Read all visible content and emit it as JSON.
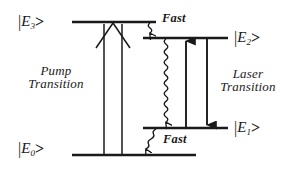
{
  "diagram": {
    "background_color": "#ffffff",
    "line_color": "#1a1a1a",
    "levels": [
      {
        "id": "E3",
        "label_bar": "|",
        "label_symbol": "E",
        "label_sub": "3",
        "label_gt": ">",
        "label_text": "|E3>",
        "x1": 72,
        "x2": 156,
        "y": 22,
        "label_x": 18,
        "label_y": 14
      },
      {
        "id": "E2",
        "label_bar": "|",
        "label_symbol": "E",
        "label_sub": "2",
        "label_gt": ">",
        "label_text": "|E2>",
        "x1": 143,
        "x2": 228,
        "y": 38,
        "label_x": 234,
        "label_y": 30
      },
      {
        "id": "E1",
        "label_bar": "|",
        "label_symbol": "E",
        "label_sub": "1",
        "label_gt": ">",
        "label_text": "|E1>",
        "x1": 143,
        "x2": 228,
        "y": 128,
        "label_x": 234,
        "label_y": 120
      },
      {
        "id": "E0",
        "label_bar": "|",
        "label_symbol": "E",
        "label_sub": "0",
        "label_gt": ">",
        "label_text": "|E0>",
        "x1": 72,
        "x2": 196,
        "y": 155,
        "label_x": 18,
        "label_y": 141
      }
    ],
    "transitions": {
      "pump": {
        "label_line1": "Pump",
        "label_line2": "Transition",
        "label_x": 14,
        "label_y": 64,
        "label_width": 84,
        "from_level": "E0",
        "to_level": "E3",
        "arrow_style": "thin-open-up",
        "arrow_left_x": 104,
        "arrow_right_x": 122,
        "apex_x": 113
      },
      "laser": {
        "label_line1": "Laser",
        "label_line2": "Transition",
        "label_x": 204,
        "label_y": 67,
        "label_width": 88,
        "up_arrow_x": 186,
        "down_arrow_x": 207,
        "from_level": "E1",
        "to_level": "E2",
        "arrow_style": "thick-filled"
      },
      "fast_decays": [
        {
          "id": "fast-E3-E2",
          "label": "Fast",
          "label_x": 182,
          "label_y": 12,
          "from_level": "E3",
          "to_level": "E2",
          "wave_x": 150,
          "y_start": 23,
          "y_end": 37,
          "style": "wavy-arrow-down"
        },
        {
          "id": "decay-E2-E1",
          "label": "",
          "label_x": 0,
          "label_y": 0,
          "from_level": "E2",
          "to_level": "E1",
          "wave_x": 166,
          "y_start": 39,
          "y_end": 127,
          "style": "wavy-arrow-down"
        },
        {
          "id": "fast-E1-E0",
          "label": "Fast",
          "label_x": 163,
          "label_y": 133,
          "from_level": "E1",
          "to_level": "E0",
          "wave_x": 156,
          "y_start": 129,
          "y_end": 154,
          "style": "wavy-arrow-down"
        }
      ]
    }
  }
}
